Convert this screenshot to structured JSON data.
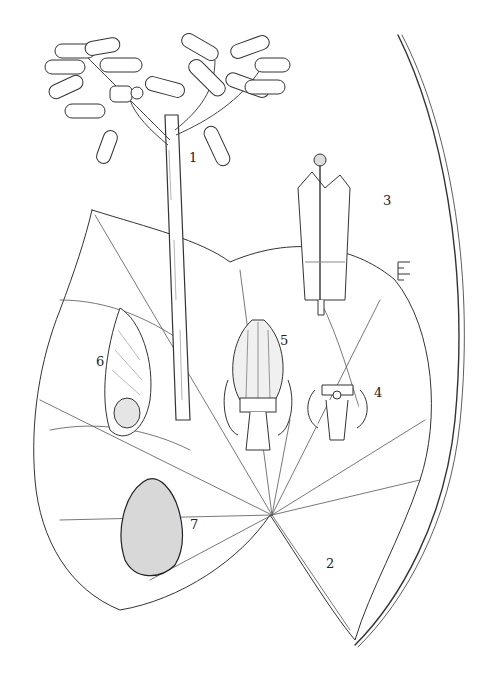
{
  "illustration": {
    "type": "botanical-plate",
    "background": "#ffffff",
    "ink": "#2a2a2a",
    "figures": [
      {
        "id": "1",
        "label": "1",
        "subject": "inflorescence with tubular flowers on stout stem",
        "label_pos": [
          190,
          152
        ]
      },
      {
        "id": "2",
        "label": "2",
        "subject": "cordate leaf with palmate venation",
        "label_pos": [
          327,
          558
        ]
      },
      {
        "id": "3",
        "label": "3",
        "subject": "longitudinal section of flower tube with style",
        "label_pos": [
          384,
          195
        ]
      },
      {
        "id": "4",
        "label": "4",
        "subject": "flower base section showing ovary",
        "label_pos": [
          375,
          387
        ]
      },
      {
        "id": "5",
        "label": "5",
        "subject": "ovoid fruit/capsule with sepals",
        "label_pos": [
          281,
          335
        ]
      },
      {
        "id": "6",
        "label": "6",
        "subject": "winged seed",
        "label_pos": [
          97,
          356
        ]
      },
      {
        "id": "7",
        "label": "7",
        "subject": "stippled ovate seed",
        "label_pos": [
          191,
          519
        ]
      }
    ],
    "scale_bar": {
      "orientation": "vertical",
      "position": [
        398,
        262
      ]
    }
  }
}
